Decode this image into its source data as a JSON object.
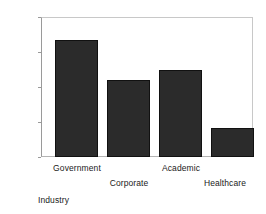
{
  "chart_data": {
    "type": "bar",
    "title": "",
    "subtitle": "",
    "xlabel": "Industry",
    "ylabel": "",
    "categories": [
      "Government",
      "Corporate",
      "Academic",
      "Healthcare"
    ],
    "values": [
      335,
      220,
      250,
      82
    ],
    "ylim": [
      0,
      400
    ],
    "yticks": [
      0,
      100,
      200,
      300,
      400
    ],
    "ytick_labels": [
      "0",
      "100",
      "200",
      "300",
      "400"
    ],
    "grid": false,
    "legend": null,
    "bar_color": "#2b2b2b",
    "bar_edge_color": "#111111",
    "axis_color": "#9a9a9a",
    "background": "#ffffff",
    "label_rows": [
      0,
      1,
      0,
      1
    ]
  }
}
